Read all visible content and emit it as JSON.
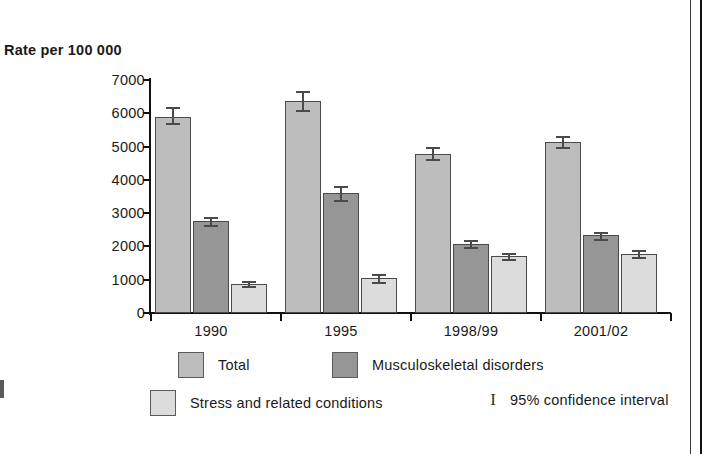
{
  "chart_data": {
    "type": "bar",
    "title": "Rate per 100 000",
    "xlabel": "",
    "ylabel": "Rate per 100 000",
    "ylim": [
      0,
      7000
    ],
    "ytick_step": 1000,
    "grid": false,
    "legend_position": "bottom",
    "categories": [
      "1990",
      "1995",
      "1998/99",
      "2001/02"
    ],
    "ytick_labels": [
      "0",
      "1000",
      "2000",
      "3000",
      "4000",
      "5000",
      "6000",
      "7000"
    ],
    "error_bar_note": "95% confidence interval",
    "series": [
      {
        "name": "Total",
        "color": "#bdbdbd",
        "values": [
          5900,
          6380,
          4780,
          5150
        ],
        "ci_low": [
          5700,
          6100,
          4620,
          5000
        ],
        "ci_high": [
          6200,
          6680,
          4980,
          5320
        ]
      },
      {
        "name": "Musculoskeletal disorders",
        "color": "#969696",
        "values": [
          2750,
          3600,
          2080,
          2330
        ],
        "ci_low": [
          2630,
          3400,
          1980,
          2230
        ],
        "ci_high": [
          2880,
          3820,
          2180,
          2430
        ]
      },
      {
        "name": "Stress and related conditions",
        "color": "#dcdcdc",
        "values": [
          870,
          1050,
          1700,
          1780
        ],
        "ci_low": [
          800,
          930,
          1620,
          1680
        ],
        "ci_high": [
          950,
          1180,
          1790,
          1880
        ]
      }
    ]
  },
  "legend": {
    "entries": [
      {
        "label": "Total",
        "swatch": "s0"
      },
      {
        "label": "Musculoskeletal disorders",
        "swatch": "s1"
      },
      {
        "label": "Stress and related conditions",
        "swatch": "s2"
      }
    ],
    "ci_glyph": "I",
    "ci_label": "95% confidence interval"
  }
}
